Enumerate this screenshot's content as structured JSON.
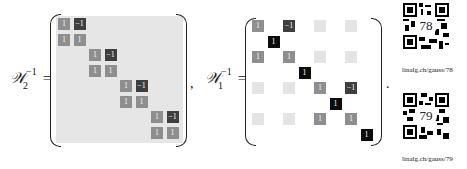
{
  "equation_left": {
    "symbol": "𝒲",
    "subscript": "2",
    "superscript": "−1",
    "equals": "=",
    "trailing": ",",
    "matrix": {
      "size": 8,
      "cells": [
        {
          "r": 0,
          "c": 0,
          "v": "1",
          "tone": "mid"
        },
        {
          "r": 0,
          "c": 1,
          "v": "−1",
          "tone": "dark"
        },
        {
          "r": 1,
          "c": 0,
          "v": "1",
          "tone": "mid"
        },
        {
          "r": 1,
          "c": 1,
          "v": "1",
          "tone": "mid"
        },
        {
          "r": 2,
          "c": 2,
          "v": "1",
          "tone": "mid"
        },
        {
          "r": 2,
          "c": 3,
          "v": "−1",
          "tone": "dark"
        },
        {
          "r": 3,
          "c": 2,
          "v": "1",
          "tone": "mid"
        },
        {
          "r": 3,
          "c": 3,
          "v": "1",
          "tone": "mid"
        },
        {
          "r": 4,
          "c": 4,
          "v": "1",
          "tone": "mid"
        },
        {
          "r": 4,
          "c": 5,
          "v": "−1",
          "tone": "dark"
        },
        {
          "r": 5,
          "c": 4,
          "v": "1",
          "tone": "mid"
        },
        {
          "r": 5,
          "c": 5,
          "v": "1",
          "tone": "mid"
        },
        {
          "r": 6,
          "c": 6,
          "v": "1",
          "tone": "mid"
        },
        {
          "r": 6,
          "c": 7,
          "v": "−1",
          "tone": "dark"
        },
        {
          "r": 7,
          "c": 6,
          "v": "1",
          "tone": "mid"
        },
        {
          "r": 7,
          "c": 7,
          "v": "1",
          "tone": "mid"
        }
      ]
    }
  },
  "equation_right": {
    "symbol": "𝒲",
    "subscript": "1",
    "superscript": "−1",
    "equals": "=",
    "trailing": ".",
    "matrix": {
      "size": 8,
      "cells": [
        {
          "r": 0,
          "c": 0,
          "v": "1",
          "tone": "mid"
        },
        {
          "r": 0,
          "c": 2,
          "v": "−1",
          "tone": "dark"
        },
        {
          "r": 0,
          "c": 4,
          "v": "",
          "tone": "light"
        },
        {
          "r": 0,
          "c": 6,
          "v": "",
          "tone": "light"
        },
        {
          "r": 1,
          "c": 1,
          "v": "1",
          "tone": "black"
        },
        {
          "r": 2,
          "c": 0,
          "v": "1",
          "tone": "mid"
        },
        {
          "r": 2,
          "c": 2,
          "v": "1",
          "tone": "mid"
        },
        {
          "r": 2,
          "c": 4,
          "v": "",
          "tone": "light"
        },
        {
          "r": 2,
          "c": 6,
          "v": "",
          "tone": "light"
        },
        {
          "r": 3,
          "c": 3,
          "v": "1",
          "tone": "black"
        },
        {
          "r": 4,
          "c": 0,
          "v": "",
          "tone": "light"
        },
        {
          "r": 4,
          "c": 2,
          "v": "",
          "tone": "light"
        },
        {
          "r": 4,
          "c": 4,
          "v": "1",
          "tone": "mid"
        },
        {
          "r": 4,
          "c": 6,
          "v": "−1",
          "tone": "dark"
        },
        {
          "r": 5,
          "c": 5,
          "v": "1",
          "tone": "black"
        },
        {
          "r": 6,
          "c": 0,
          "v": "",
          "tone": "light"
        },
        {
          "r": 6,
          "c": 2,
          "v": "",
          "tone": "light"
        },
        {
          "r": 6,
          "c": 4,
          "v": "1",
          "tone": "mid"
        },
        {
          "r": 6,
          "c": 6,
          "v": "1",
          "tone": "mid"
        },
        {
          "r": 7,
          "c": 7,
          "v": "1",
          "tone": "black"
        }
      ]
    }
  },
  "qr_codes": [
    {
      "number": "78",
      "label": "linalg.ch/gauss/78"
    },
    {
      "number": "79",
      "label": "linalg.ch/gauss/79"
    }
  ],
  "colors": {
    "mid": "#8e8e8e",
    "dark": "#3e3e3e",
    "black": "#0c0c0c",
    "light": "#e4e4e4",
    "matrix_bg": "#e6e6e6"
  }
}
